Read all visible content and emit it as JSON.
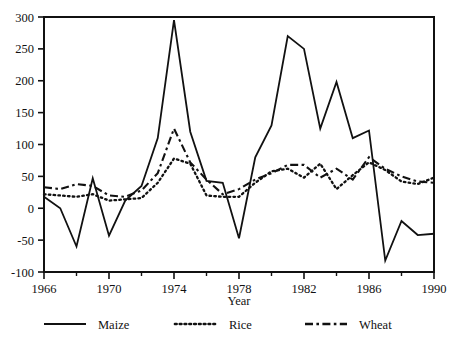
{
  "chart_data": {
    "type": "line",
    "title": "",
    "xlabel": "Year",
    "ylabel": "",
    "xlim": [
      1966,
      1990
    ],
    "ylim": [
      -100,
      300
    ],
    "xticks": [
      1966,
      1970,
      1974,
      1978,
      1982,
      1986,
      1990
    ],
    "xtick_labels": [
      "1966",
      "1970",
      "1974",
      "1978",
      "1982",
      "1986",
      "1990"
    ],
    "xminor_ticks": [
      1968,
      1972,
      1976,
      1980,
      1984,
      1988
    ],
    "yticks": [
      -100,
      -50,
      0,
      50,
      100,
      150,
      200,
      250,
      300
    ],
    "ytick_labels": [
      "-100",
      "-50",
      "0",
      "50",
      "100",
      "150",
      "200",
      "250",
      "300"
    ],
    "grid": false,
    "legend_position": "below",
    "x": [
      1966,
      1967,
      1968,
      1969,
      1970,
      1971,
      1972,
      1973,
      1974,
      1975,
      1976,
      1977,
      1978,
      1979,
      1980,
      1981,
      1982,
      1983,
      1984,
      1985,
      1986,
      1987,
      1988,
      1989,
      1990
    ],
    "series": [
      {
        "name": "Maize",
        "style": "solid",
        "color": "#111111",
        "values": [
          18,
          0,
          -60,
          47,
          -43,
          12,
          35,
          110,
          295,
          120,
          43,
          40,
          -47,
          80,
          130,
          270,
          250,
          125,
          198,
          110,
          122,
          -82,
          -20,
          -42,
          -40
        ]
      },
      {
        "name": "Rice",
        "style": "dotted",
        "color": "#111111",
        "values": [
          22,
          20,
          18,
          22,
          12,
          14,
          16,
          40,
          78,
          70,
          20,
          18,
          18,
          40,
          58,
          62,
          48,
          70,
          30,
          52,
          72,
          60,
          42,
          38,
          48
        ]
      },
      {
        "name": "Wheat",
        "style": "dashed",
        "color": "#111111",
        "values": [
          33,
          30,
          38,
          35,
          20,
          18,
          28,
          55,
          125,
          72,
          45,
          22,
          30,
          45,
          55,
          68,
          68,
          48,
          62,
          45,
          80,
          62,
          50,
          42,
          40
        ]
      }
    ]
  },
  "legend": {
    "items": [
      {
        "label": "Maize",
        "style": "solid"
      },
      {
        "label": "Rice",
        "style": "dotted"
      },
      {
        "label": "Wheat",
        "style": "dashed"
      }
    ]
  },
  "axis": {
    "x_title": "Year"
  }
}
